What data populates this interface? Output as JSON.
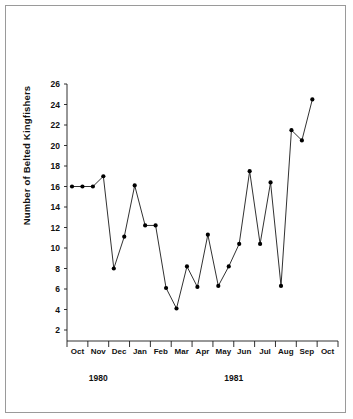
{
  "chart_data": {
    "type": "line",
    "title": "",
    "xlabel": "",
    "ylabel": "Number of Belted Kingfishers",
    "ylim": [
      0,
      26
    ],
    "yticks": [
      2,
      4,
      6,
      8,
      10,
      12,
      14,
      16,
      18,
      20,
      22,
      24,
      26
    ],
    "grid": false,
    "legend": null,
    "xtick_labels": [
      "Oct",
      "Nov",
      "Dec",
      "Jan",
      "Feb",
      "Mar",
      "Apr",
      "May",
      "Jun",
      "Jul",
      "Aug",
      "Sep",
      "Oct"
    ],
    "group_labels": [
      {
        "text": "1980",
        "spans": [
          "Oct",
          "Nov",
          "Dec"
        ]
      },
      {
        "text": "1981",
        "spans": [
          "Jan",
          "Feb",
          "Mar",
          "Apr",
          "May",
          "Jun",
          "Jul",
          "Aug",
          "Sep",
          "Oct"
        ]
      }
    ],
    "x": [
      0,
      1,
      2,
      3,
      4,
      5,
      6,
      7,
      8,
      9,
      10,
      11,
      12,
      13,
      14,
      15,
      16,
      17,
      18,
      19,
      20,
      21,
      22,
      23
    ],
    "values": [
      16,
      16,
      16,
      17,
      8,
      11.1,
      16.1,
      12.2,
      12.2,
      6.1,
      4.1,
      8.2,
      6.2,
      11.3,
      6.3,
      8.2,
      10.4,
      17.5,
      10.4,
      16.4,
      6.3,
      21.5,
      20.5,
      24.5
    ],
    "marker": "filled-circle",
    "line_color": "#1a1a1a",
    "marker_color": "#000000"
  },
  "axis": {
    "y_axis_name": "y-axis",
    "x_axis_name": "x-axis"
  }
}
